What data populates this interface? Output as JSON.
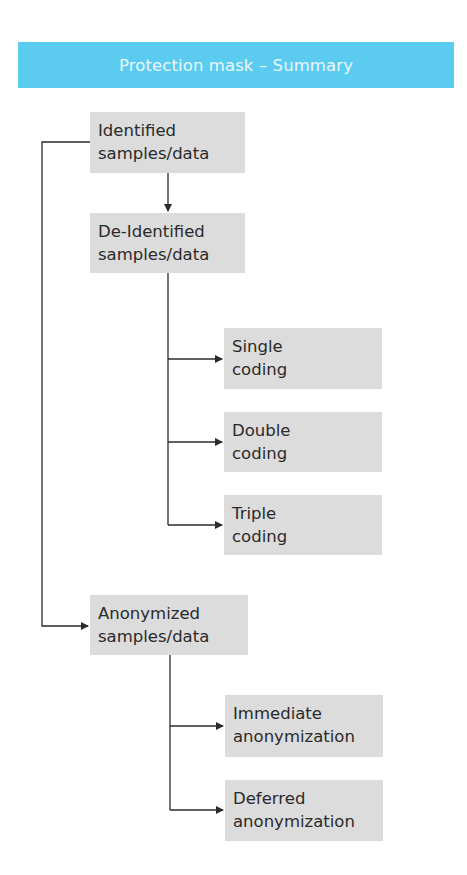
{
  "header": {
    "title": "Protection mask – Summary",
    "color": "#5ccbf0"
  },
  "nodes": {
    "identified": "Identified\nsamples/data",
    "deidentified": "De-Identified\nsamples/data",
    "single": "Single\ncoding",
    "double": "Double\ncoding",
    "triple": "Triple\ncoding",
    "anonymized": "Anonymized\nsamples/data",
    "immediate": "Immediate\nanonymization",
    "deferred": "Deferred\nanonymization"
  },
  "edges": [
    {
      "from": "identified",
      "to": "deidentified"
    },
    {
      "from": "identified",
      "to": "anonymized"
    },
    {
      "from": "deidentified",
      "to": "single"
    },
    {
      "from": "deidentified",
      "to": "double"
    },
    {
      "from": "deidentified",
      "to": "triple"
    },
    {
      "from": "anonymized",
      "to": "immediate"
    },
    {
      "from": "anonymized",
      "to": "deferred"
    }
  ]
}
